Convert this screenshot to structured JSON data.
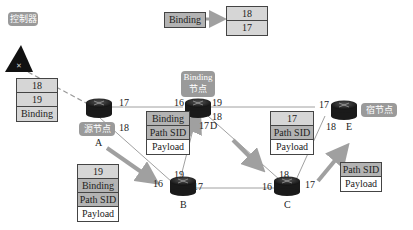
{
  "controller": {
    "label": "控制器"
  },
  "nodes": {
    "A": {
      "name": "A",
      "tag": "源节点"
    },
    "B": {
      "name": "B"
    },
    "C": {
      "name": "C"
    },
    "D": {
      "name": "D",
      "tag": "Binding\n节点",
      "tag_line1": "Binding",
      "tag_line2": "节点"
    },
    "E": {
      "name": "E",
      "tag": "宿节点"
    }
  },
  "ports": {
    "A_17": "17",
    "A_18": "18",
    "B_16": "16",
    "B_19": "19",
    "B_17": "17",
    "D_16": "16",
    "D_19": "19",
    "D_18": "18",
    "D_17": "17",
    "C_16": "16",
    "C_18": "18",
    "C_17": "17",
    "E_17": "17",
    "E_18": "18"
  },
  "binding_legend": {
    "key": "Binding",
    "values": [
      "18",
      "17"
    ]
  },
  "stacks": {
    "at_A": [
      "18",
      "19",
      "Binding"
    ],
    "A_to_B": [
      "19",
      "Binding",
      "Path SID",
      "Payload"
    ],
    "B_to_D": [
      "Binding",
      "Path SID",
      "Payload"
    ],
    "D_to_C": [
      "17",
      "Path SID",
      "Payload"
    ],
    "C_to_E": [
      "Path SID",
      "Payload"
    ]
  },
  "colors": {
    "link": "#9a9a9a",
    "arrow": "#a0a0a0",
    "tag_bg": "#9a9a9a",
    "router": "#2a2a2a"
  }
}
